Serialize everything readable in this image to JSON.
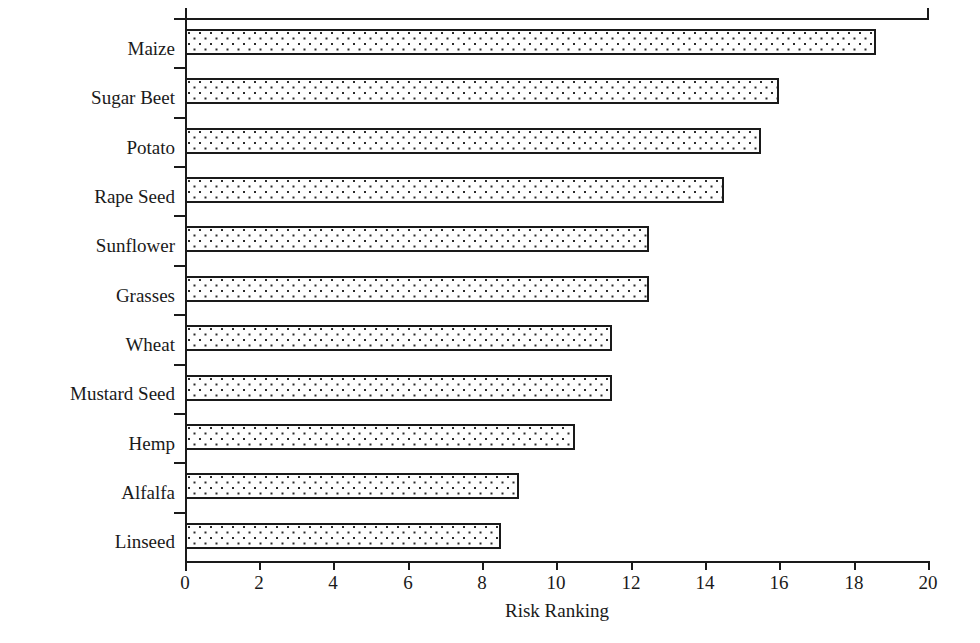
{
  "chart_data": {
    "type": "bar",
    "orientation": "horizontal",
    "title": "",
    "subtitle": "",
    "xlabel": "Risk Ranking",
    "ylabel": "",
    "categories": [
      "Maize",
      "Sugar Beet",
      "Potato",
      "Rape Seed",
      "Sunflower",
      "Grasses",
      "Wheat",
      "Mustard Seed",
      "Hemp",
      "Alfalfa",
      "Linseed"
    ],
    "values": [
      18.6,
      16.0,
      15.5,
      14.5,
      12.5,
      12.5,
      11.5,
      11.5,
      10.5,
      9.0,
      8.5
    ],
    "xlim": [
      0,
      20
    ],
    "xticks": [
      0,
      2,
      4,
      6,
      8,
      10,
      12,
      14,
      16,
      18,
      20
    ],
    "xtick_labels": [
      "0",
      "2",
      "4",
      "6",
      "8",
      "10",
      "12",
      "14",
      "16",
      "18",
      "20"
    ],
    "grid": false,
    "legend": null,
    "legend_position": "none",
    "annotations": [],
    "colors": {
      "bar_fill": "#fefefe",
      "bar_pattern_dot": "#2b2b2b",
      "bar_border": "#1a1a1a",
      "axis": "#1a1a1a",
      "text": "#1a1a1a",
      "background": "#ffffff"
    }
  }
}
